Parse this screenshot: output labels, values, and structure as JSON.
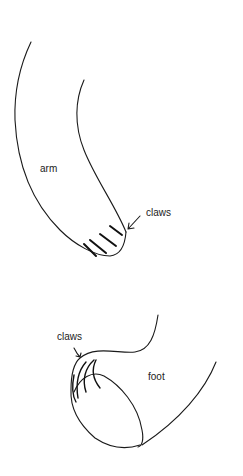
{
  "figure": {
    "arm": {
      "label": "arm",
      "claws_label": "claws"
    },
    "foot": {
      "label": "foot",
      "claws_label": "claws"
    },
    "colors": {
      "line": "#1a1a1a",
      "background": "#ffffff"
    }
  }
}
